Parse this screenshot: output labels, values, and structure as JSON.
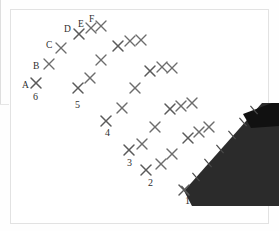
{
  "figure": {
    "type": "survey-control-point-diagram",
    "background_color": "#ffffff",
    "marker_color": "#6d6d6d",
    "label_color": "#2e2e2e",
    "roof_color": "#2b2b2b",
    "roof_band_color": "#111111",
    "frame_color": "#e2e2e2"
  },
  "column_labels": [
    {
      "text": "A",
      "x": 22,
      "y": 81
    },
    {
      "text": "B",
      "x": 33,
      "y": 62
    },
    {
      "text": "C",
      "x": 46,
      "y": 41
    },
    {
      "text": "D",
      "x": 64,
      "y": 25
    },
    {
      "text": "E",
      "x": 78,
      "y": 20
    },
    {
      "text": "F",
      "x": 89,
      "y": 15
    }
  ],
  "row_labels": [
    {
      "text": "1",
      "x": 185,
      "y": 196
    },
    {
      "text": "2",
      "x": 148,
      "y": 178
    },
    {
      "text": "3",
      "x": 127,
      "y": 158
    },
    {
      "text": "4",
      "x": 105,
      "y": 128
    },
    {
      "text": "5",
      "x": 75,
      "y": 100
    },
    {
      "text": "6",
      "x": 33,
      "y": 92
    }
  ],
  "markers": [
    {
      "id": "A6",
      "x": 36,
      "y": 83
    },
    {
      "id": "B6",
      "x": 49,
      "y": 64
    },
    {
      "id": "C6",
      "x": 61,
      "y": 48
    },
    {
      "id": "D6",
      "x": 79,
      "y": 34
    },
    {
      "id": "E6",
      "x": 91,
      "y": 28
    },
    {
      "id": "F6",
      "x": 101,
      "y": 26
    },
    {
      "id": "A5",
      "x": 78,
      "y": 88
    },
    {
      "id": "B5",
      "x": 90,
      "y": 78
    },
    {
      "id": "C5",
      "x": 101,
      "y": 60
    },
    {
      "id": "D5",
      "x": 118,
      "y": 46
    },
    {
      "id": "E5",
      "x": 130,
      "y": 41
    },
    {
      "id": "F5",
      "x": 141,
      "y": 40
    },
    {
      "id": "A4",
      "x": 106,
      "y": 121
    },
    {
      "id": "B4",
      "x": 122,
      "y": 108
    },
    {
      "id": "C4",
      "x": 135,
      "y": 88
    },
    {
      "id": "D4",
      "x": 150,
      "y": 71
    },
    {
      "id": "E4",
      "x": 162,
      "y": 67
    },
    {
      "id": "F4",
      "x": 172,
      "y": 68
    },
    {
      "id": "A3",
      "x": 129,
      "y": 150
    },
    {
      "id": "B3",
      "x": 142,
      "y": 144
    },
    {
      "id": "C3",
      "x": 155,
      "y": 127
    },
    {
      "id": "D3",
      "x": 170,
      "y": 109
    },
    {
      "id": "E3",
      "x": 181,
      "y": 106
    },
    {
      "id": "F3",
      "x": 192,
      "y": 103
    },
    {
      "id": "A2",
      "x": 146,
      "y": 170
    },
    {
      "id": "B2",
      "x": 161,
      "y": 164
    },
    {
      "id": "C2",
      "x": 172,
      "y": 154
    },
    {
      "id": "D2",
      "x": 188,
      "y": 138
    },
    {
      "id": "E2",
      "x": 199,
      "y": 132
    },
    {
      "id": "F2",
      "x": 209,
      "y": 127
    },
    {
      "id": "A1",
      "x": 184,
      "y": 190
    }
  ],
  "edge_ticks": [
    {
      "x": 185,
      "y": 190
    },
    {
      "x": 196,
      "y": 177
    },
    {
      "x": 208,
      "y": 163
    },
    {
      "x": 220,
      "y": 149
    },
    {
      "x": 232,
      "y": 135
    },
    {
      "x": 243,
      "y": 122
    },
    {
      "x": 254,
      "y": 110
    }
  ],
  "roof": {
    "main_polygon": "184,191 262,103 279,103 279,206 192,206",
    "band_polygon": "243,114 272,103 279,103 279,126 251,128"
  }
}
